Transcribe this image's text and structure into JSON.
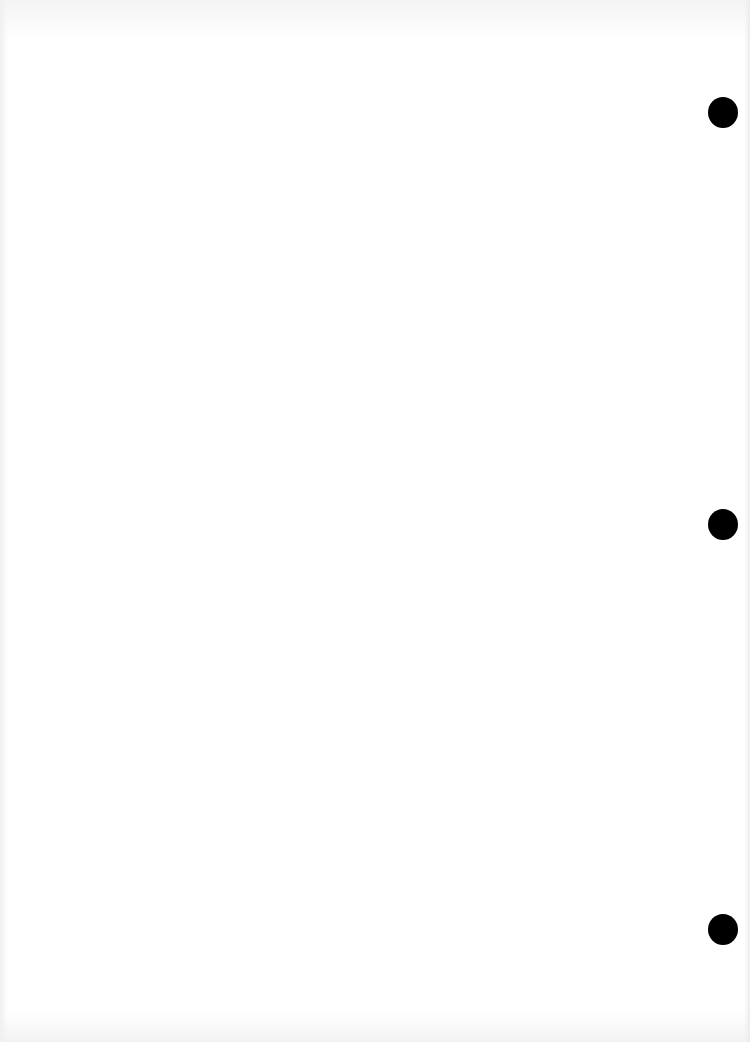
{
  "page": {
    "background_color": "#ffffff",
    "content": "blank scanned page"
  },
  "punch_holes": [
    {
      "name": "top",
      "left": 708,
      "top": 97,
      "color": "#000000"
    },
    {
      "name": "middle",
      "left": 708,
      "top": 509,
      "color": "#000000"
    },
    {
      "name": "bottom",
      "left": 708,
      "top": 914,
      "color": "#000000"
    }
  ]
}
